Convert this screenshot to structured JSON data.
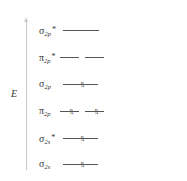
{
  "axis": {
    "label": "E"
  },
  "orbitals": [
    {
      "name": "σ",
      "sub": "2p",
      "star": "*",
      "levels": 1,
      "electrons": [
        ""
      ]
    },
    {
      "name": "π",
      "sub": "2p",
      "star": "*",
      "levels": 2,
      "electrons": [
        "",
        ""
      ]
    },
    {
      "name": "σ",
      "sub": "2p",
      "star": "",
      "levels": 1,
      "electrons": [
        "↑↓"
      ]
    },
    {
      "name": "π",
      "sub": "2p",
      "star": "",
      "levels": 2,
      "electrons": [
        "↑↓",
        "↑↓"
      ]
    },
    {
      "name": "σ",
      "sub": "2s",
      "star": "*",
      "levels": 1,
      "electrons": [
        "↑↓"
      ]
    },
    {
      "name": "σ",
      "sub": "2s",
      "star": "",
      "levels": 1,
      "electrons": [
        "↑↓"
      ]
    }
  ]
}
